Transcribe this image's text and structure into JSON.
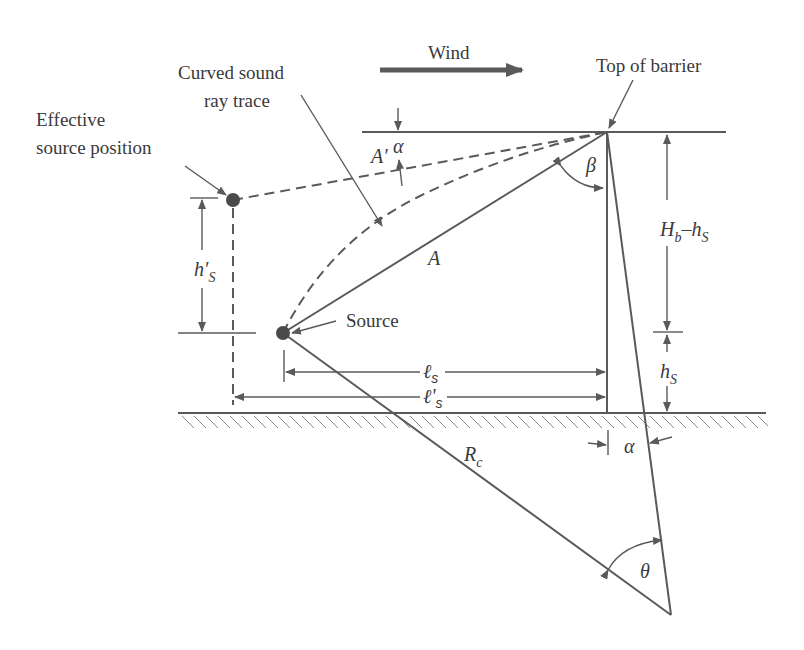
{
  "diagram": {
    "labels": {
      "wind": "Wind",
      "top_of_barrier": "Top of barrier",
      "curved_ray_line1": "Curved sound",
      "curved_ray_line2": "ray trace",
      "effective_source_line1": "Effective",
      "effective_source_line2": "source position",
      "source": "Source"
    },
    "symbols": {
      "A": "A",
      "A_prime": "A′",
      "alpha_top": "α",
      "alpha_bottom": "α",
      "beta": "β",
      "theta": "θ",
      "Rc_main": "R",
      "Rc_sub": "c",
      "hs_prime_main": "h′",
      "hs_prime_sub": "S",
      "Hb_main": "H",
      "Hb_sub": "b",
      "Hb_minus": "–h",
      "Hb_minus_sub": "S",
      "hs_main": "h",
      "hs_sub": "S",
      "ls_main": "ℓ",
      "ls_sub": "s",
      "ls_prime_main": "ℓ'",
      "ls_prime_sub": "s"
    },
    "colors": {
      "line": "#5a5a5a",
      "text": "#3a3a3a",
      "background": "#ffffff"
    }
  }
}
